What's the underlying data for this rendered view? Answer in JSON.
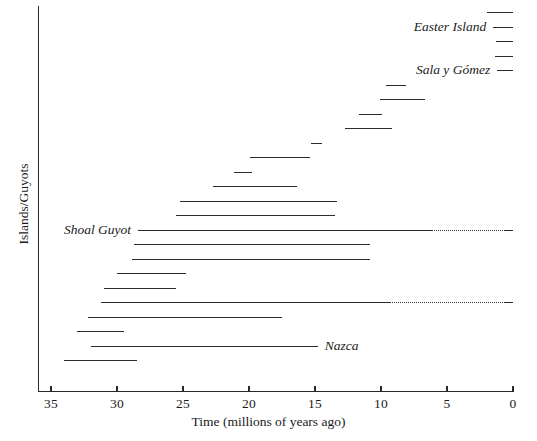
{
  "chart_data": {
    "type": "bar",
    "orientation": "horizontal-range",
    "title": "",
    "xlabel": "Time (millions of years ago)",
    "ylabel": "Islands/Guyots",
    "xlim": [
      35,
      0
    ],
    "xticks": [
      35,
      30,
      25,
      20,
      15,
      10,
      5,
      0
    ],
    "xtick_labels": [
      "35",
      "30",
      "25",
      "20",
      "15",
      "10",
      "5",
      "0"
    ],
    "x_axis_reversed": true,
    "grid": false,
    "legend": null,
    "units": "millions of years ago",
    "note": "Each horizontal segment is the age range of one island or guyot of the Easter Seamount / Nazca Ridge chain; dotted segments indicate inferred or uncertain continuation to the present.",
    "bars": [
      {
        "index": 1,
        "label": "",
        "start_ma": 2.0,
        "end_ma": 0.0,
        "solid_end_ma": 0.0,
        "dotted": false
      },
      {
        "index": 2,
        "label": "Easter Island",
        "start_ma": 1.5,
        "end_ma": 0.0,
        "solid_end_ma": 0.0,
        "dotted": false
      },
      {
        "index": 3,
        "label": "",
        "start_ma": 1.3,
        "end_ma": 0.0,
        "solid_end_ma": 0.0,
        "dotted": false
      },
      {
        "index": 4,
        "label": "",
        "start_ma": 1.4,
        "end_ma": 0.0,
        "solid_end_ma": 0.0,
        "dotted": false
      },
      {
        "index": 5,
        "label": "Sala y Gómez",
        "start_ma": 1.2,
        "end_ma": 0.0,
        "solid_end_ma": 0.0,
        "dotted": false
      },
      {
        "index": 6,
        "label": "",
        "start_ma": 9.6,
        "end_ma": 8.1,
        "solid_end_ma": 8.1,
        "dotted": false
      },
      {
        "index": 7,
        "label": "",
        "start_ma": 10.1,
        "end_ma": 6.7,
        "solid_end_ma": 6.7,
        "dotted": false
      },
      {
        "index": 8,
        "label": "",
        "start_ma": 11.7,
        "end_ma": 9.9,
        "solid_end_ma": 9.9,
        "dotted": false
      },
      {
        "index": 9,
        "label": "",
        "start_ma": 12.7,
        "end_ma": 9.2,
        "solid_end_ma": 9.2,
        "dotted": false
      },
      {
        "index": 10,
        "label": "",
        "start_ma": 15.3,
        "end_ma": 14.5,
        "solid_end_ma": 14.5,
        "dotted": false
      },
      {
        "index": 11,
        "label": "",
        "start_ma": 19.9,
        "end_ma": 15.4,
        "solid_end_ma": 15.4,
        "dotted": false
      },
      {
        "index": 12,
        "label": "",
        "start_ma": 21.1,
        "end_ma": 19.8,
        "solid_end_ma": 19.8,
        "dotted": false
      },
      {
        "index": 13,
        "label": "",
        "start_ma": 22.7,
        "end_ma": 16.4,
        "solid_end_ma": 16.4,
        "dotted": false
      },
      {
        "index": 14,
        "label": "",
        "start_ma": 25.2,
        "end_ma": 13.3,
        "solid_end_ma": 13.3,
        "dotted": false
      },
      {
        "index": 15,
        "label": "",
        "start_ma": 25.5,
        "end_ma": 13.5,
        "solid_end_ma": 13.5,
        "dotted": false
      },
      {
        "index": 16,
        "label": "Shoal Guyot",
        "start_ma": 28.4,
        "end_ma": 0.0,
        "solid_end_ma": 6.1,
        "dotted": true
      },
      {
        "index": 17,
        "label": "",
        "start_ma": 28.7,
        "end_ma": 10.8,
        "solid_end_ma": 10.8,
        "dotted": false
      },
      {
        "index": 18,
        "label": "",
        "start_ma": 28.9,
        "end_ma": 10.8,
        "solid_end_ma": 10.8,
        "dotted": false
      },
      {
        "index": 19,
        "label": "",
        "start_ma": 30.0,
        "end_ma": 24.8,
        "solid_end_ma": 24.8,
        "dotted": false
      },
      {
        "index": 20,
        "label": "",
        "start_ma": 31.0,
        "end_ma": 25.5,
        "solid_end_ma": 25.5,
        "dotted": false
      },
      {
        "index": 21,
        "label": "",
        "start_ma": 31.2,
        "end_ma": 0.0,
        "solid_end_ma": 9.3,
        "dotted": true
      },
      {
        "index": 22,
        "label": "",
        "start_ma": 32.2,
        "end_ma": 17.5,
        "solid_end_ma": 17.5,
        "dotted": false
      },
      {
        "index": 23,
        "label": "",
        "start_ma": 33.0,
        "end_ma": 29.5,
        "solid_end_ma": 29.5,
        "dotted": false
      },
      {
        "index": 24,
        "label": "Nazca",
        "start_ma": 32.0,
        "end_ma": 14.8,
        "solid_end_ma": 14.8,
        "dotted": false
      },
      {
        "index": 25,
        "label": "",
        "start_ma": 34.0,
        "end_ma": 28.5,
        "solid_end_ma": 28.5,
        "dotted": false
      }
    ],
    "labels": [
      {
        "text": "Easter Island",
        "bar_index": 2,
        "position": "left-of-bar"
      },
      {
        "text": "Sala y Gómez",
        "bar_index": 5,
        "position": "left-of-bar"
      },
      {
        "text": "Shoal Guyot",
        "bar_index": 16,
        "position": "left-of-bar"
      },
      {
        "text": "Nazca",
        "bar_index": 24,
        "position": "right-of-bar"
      }
    ]
  },
  "colors": {
    "background": "#ffffff",
    "axis": "#2a2a2a",
    "bar": "#2b2b2b",
    "text": "#1a1a1a"
  }
}
